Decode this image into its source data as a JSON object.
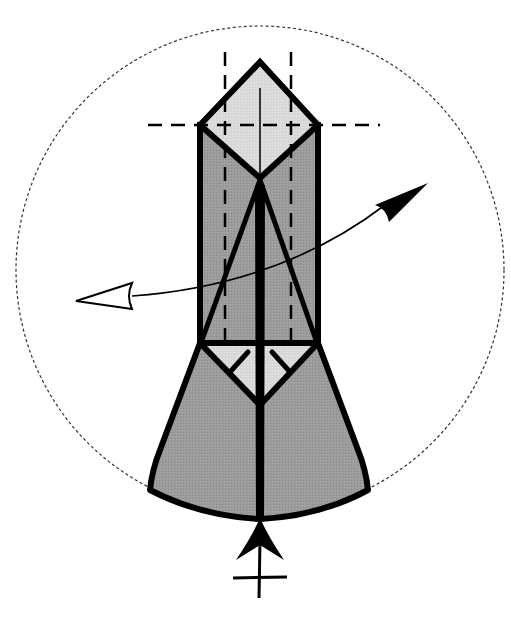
{
  "diagram": {
    "type": "origami-step",
    "colors": {
      "background": "#ffffff",
      "outline": "#000000",
      "paper_dark": "#9a9a9a",
      "paper_light": "#d9d9d9",
      "dashed_circle": "#333333"
    },
    "elements": {
      "rotation_circle": {
        "cx": 260,
        "cy": 270,
        "r": 244,
        "style": "dotted"
      },
      "top_diamond": {
        "points": "260,62 318,125 260,178 200,125",
        "fill": "paper_light"
      },
      "body_rectangle": {
        "x": 200,
        "y": 125,
        "w": 118,
        "h": 218,
        "fill": "paper_dark"
      },
      "lower_flare": {
        "fill": "paper_dark"
      },
      "inner_triangle": {
        "points": "200,343 318,343 260,405",
        "fill": "paper_light"
      },
      "valley_fold_lines": [
        {
          "x1": 225,
          "y1": 52,
          "x2": 225,
          "y2": 340
        },
        {
          "x1": 291,
          "y1": 52,
          "x2": 291,
          "y2": 340
        },
        {
          "x1": 148,
          "y1": 125,
          "x2": 378,
          "y2": 125
        }
      ],
      "turn_over_arrow": {
        "from": "left-open-head",
        "to": "right-filled-head"
      },
      "pivot_symbol": "bottom-arrow-with-crossbar"
    }
  }
}
